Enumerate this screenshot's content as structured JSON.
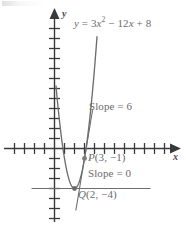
{
  "figure": {
    "width": 186,
    "height": 226,
    "background": "#ffffff",
    "curve_color": "#6e6e6e",
    "axis_color": "#3a3a3a",
    "text_color": "#6b6b6b"
  },
  "labels": {
    "equation": "y = 3x2 − 12x + 8",
    "equation_lhs": "y",
    "equation_eq": " = 3",
    "equation_var": "x",
    "equation_exp": "2",
    "equation_rest": " − 12",
    "equation_var2": "x",
    "equation_tail": " + 8",
    "slope_at_p": "Slope  =  6",
    "slope_at_q": "Slope  =  0",
    "point_p": "P(3,  −1)",
    "point_p_name": "P",
    "point_p_coords": "(3,  −1)",
    "point_q": "Q(2,  −4)",
    "point_q_name": "Q",
    "point_q_coords": "(2,  −4)",
    "y_axis_name": "y",
    "x_axis_name": "x"
  },
  "chart_data": {
    "type": "line",
    "xlabel": "x",
    "ylabel": "y",
    "function": "y = 3x^2 - 12x + 8",
    "coefficients": {
      "a": 3,
      "b": -12,
      "c": 8
    },
    "xlim": [
      -5.4,
      12.4
    ],
    "ylim": [
      -8.0,
      13.5
    ],
    "grid": false,
    "legend": "none",
    "axis_ticks": {
      "x_spacing": 1,
      "y_spacing": 1,
      "x_tick_values": [
        -5,
        -4,
        -3,
        -2,
        -1,
        1,
        2,
        3,
        4,
        5,
        6,
        7,
        8,
        9,
        10,
        11
      ],
      "y_tick_values": [
        -8,
        -7,
        -6,
        -5,
        -4,
        -3,
        -2,
        -1,
        1,
        2,
        3,
        4,
        5,
        6,
        7,
        8,
        9,
        10,
        11,
        12
      ]
    },
    "points": [
      {
        "name": "P",
        "x": 3,
        "y": -1,
        "label": "P(3,  −1)",
        "tangent_slope": 6
      },
      {
        "name": "Q",
        "x": 2,
        "y": -4,
        "label": "Q(2,  −4)",
        "tangent_slope": 0
      }
    ],
    "annotations": [
      {
        "text": "y = 3x² − 12x + 8",
        "target": "curve"
      },
      {
        "text": "Slope  =  6",
        "target": "tangent-at-P"
      },
      {
        "text": "Slope  =  0",
        "target": "tangent-at-Q"
      }
    ],
    "series": [
      {
        "name": "parabola",
        "x": [
          0.3,
          0.6,
          0.9,
          1.2,
          1.5,
          1.8,
          2.0,
          2.2,
          2.5,
          2.8,
          3.0,
          3.3,
          3.6,
          3.9,
          4.2
        ],
        "values": [
          4.67,
          1.88,
          -0.37,
          -2.08,
          -3.25,
          -3.88,
          -4.0,
          -3.88,
          -3.25,
          -2.08,
          -1.0,
          1.07,
          3.68,
          6.83,
          10.52
        ]
      },
      {
        "name": "tangent-at-P",
        "slope": 6,
        "through": [
          3,
          -1
        ],
        "equation": "y = 6x - 19"
      },
      {
        "name": "tangent-at-Q",
        "slope": 0,
        "through": [
          2,
          -4
        ],
        "equation": "y = -4"
      }
    ]
  }
}
